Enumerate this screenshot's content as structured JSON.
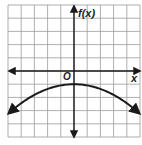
{
  "chart_data": {
    "type": "line",
    "title": "",
    "xlabel": "x",
    "ylabel": "f(x)",
    "origin_label": "O",
    "xlim": [
      -5,
      5
    ],
    "ylim": [
      -5,
      5
    ],
    "grid": true,
    "grid_step": 1,
    "legend": null,
    "function": "f(x) = -0.09x^2 - 1 (downward-opening parabola, vertex at (0, -1))",
    "series": [
      {
        "name": "f(x)",
        "x": [
          -5,
          -4,
          -3,
          -2,
          -1,
          0,
          1,
          2,
          3,
          4,
          5
        ],
        "values": [
          -3.25,
          -2.44,
          -1.81,
          -1.36,
          -1.09,
          -1,
          -1.09,
          -1.36,
          -1.81,
          -2.44,
          -3.25
        ]
      }
    ],
    "arrows": "both ends of curve and both ends of each axis"
  },
  "labels": {
    "y_axis": "f(x)",
    "x_axis": "x",
    "origin": "O"
  },
  "colors": {
    "grid": "#9a9a9a",
    "axis": "#1a1a1a",
    "curve": "#1a1a1a",
    "background": "#ffffff"
  }
}
